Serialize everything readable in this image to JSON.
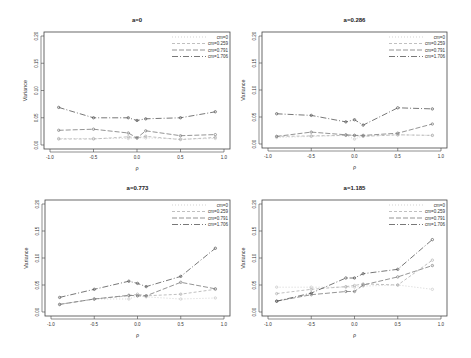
{
  "figure": {
    "ylabel": "Variance",
    "xlabel": "ρ",
    "colors": {
      "cm=0": "#c8c8c8",
      "cm=0.259": "#b0b0b0",
      "cm=0.791": "#7a7a7a",
      "cm=1.706": "#555555"
    }
  },
  "chart_data": [
    {
      "type": "line",
      "title": "a=0",
      "xlabel": "ρ",
      "ylabel": "Variance",
      "xlim": [
        -1.0,
        1.0
      ],
      "ylim": [
        0.0,
        0.2
      ],
      "xticks": [
        "-1.0",
        "-0.5",
        "0.0",
        "0.5",
        "1.0"
      ],
      "yticks": [
        "0.00",
        "0.05",
        "0.10",
        "0.15",
        "0.20"
      ],
      "legend": [
        "cm=0",
        "cm=0.259",
        "cm=0.791",
        "cm=1.706"
      ],
      "legend_position": "top-right",
      "x": [
        -0.9,
        -0.5,
        -0.1,
        0.0,
        0.1,
        0.5,
        0.9
      ],
      "series": [
        {
          "name": "cm=0",
          "values": [
            0.012,
            0.012,
            0.012,
            0.013,
            0.013,
            0.011,
            0.012
          ]
        },
        {
          "name": "cm=0.259",
          "values": [
            0.011,
            0.011,
            0.015,
            0.013,
            0.016,
            0.01,
            0.014
          ]
        },
        {
          "name": "cm=0.791",
          "values": [
            0.027,
            0.029,
            0.022,
            0.013,
            0.026,
            0.017,
            0.019
          ]
        },
        {
          "name": "cm=1.706",
          "values": [
            0.069,
            0.05,
            0.05,
            0.045,
            0.048,
            0.05,
            0.061
          ]
        }
      ]
    },
    {
      "type": "line",
      "title": "a=0.286",
      "xlabel": "ρ",
      "ylabel": "Variance",
      "xlim": [
        -1.0,
        1.0
      ],
      "ylim": [
        0.0,
        0.2
      ],
      "xticks": [
        "-1.0",
        "-0.5",
        "0.0",
        "0.5",
        "1.0"
      ],
      "yticks": [
        "0.00",
        "0.05",
        "0.10",
        "0.15",
        "0.20"
      ],
      "legend": [
        "cm=0",
        "cm=0.259",
        "cm=0.791",
        "cm=1.706"
      ],
      "legend_position": "top-right",
      "x": [
        -0.9,
        -0.5,
        -0.1,
        0.0,
        0.1,
        0.5,
        0.9
      ],
      "series": [
        {
          "name": "cm=0",
          "values": [
            0.012,
            0.014,
            0.016,
            0.009,
            0.015,
            0.017,
            0.016
          ]
        },
        {
          "name": "cm=0.259",
          "values": [
            0.014,
            0.015,
            0.016,
            0.016,
            0.014,
            0.017,
            0.016
          ]
        },
        {
          "name": "cm=0.791",
          "values": [
            0.014,
            0.022,
            0.017,
            0.016,
            0.016,
            0.02,
            0.037
          ]
        },
        {
          "name": "cm=1.706",
          "values": [
            0.056,
            0.053,
            0.041,
            0.045,
            0.035,
            0.067,
            0.065
          ]
        }
      ]
    },
    {
      "type": "line",
      "title": "a=0.773",
      "xlabel": "ρ",
      "ylabel": "Variance",
      "xlim": [
        -1.0,
        1.0
      ],
      "ylim": [
        0.0,
        0.2
      ],
      "xticks": [
        "-1.0",
        "-0.5",
        "0.0",
        "0.5",
        "1.0"
      ],
      "yticks": [
        "0.00",
        "0.05",
        "0.10",
        "0.15",
        "0.20"
      ],
      "legend": [
        "cm=0",
        "cm=0.259",
        "cm=0.791",
        "cm=1.706"
      ],
      "legend_position": "top-right",
      "x": [
        -0.9,
        -0.5,
        -0.1,
        0.0,
        0.1,
        0.5,
        0.9
      ],
      "series": [
        {
          "name": "cm=0",
          "values": [
            0.014,
            0.024,
            0.024,
            0.03,
            0.028,
            0.024,
            0.026
          ]
        },
        {
          "name": "cm=0.259",
          "values": [
            0.014,
            0.024,
            0.03,
            0.033,
            0.03,
            0.033,
            0.042
          ]
        },
        {
          "name": "cm=0.791",
          "values": [
            0.014,
            0.024,
            0.031,
            0.03,
            0.03,
            0.055,
            0.043
          ]
        },
        {
          "name": "cm=1.706",
          "values": [
            0.027,
            0.042,
            0.057,
            0.053,
            0.047,
            0.066,
            0.118
          ]
        }
      ]
    },
    {
      "type": "line",
      "title": "a=1.185",
      "xlabel": "ρ",
      "ylabel": "Variance",
      "xlim": [
        -1.0,
        1.0
      ],
      "ylim": [
        0.0,
        0.2
      ],
      "xticks": [
        "-1.0",
        "-0.5",
        "0.0",
        "0.5",
        "1.0"
      ],
      "yticks": [
        "0.00",
        "0.05",
        "0.10",
        "0.15",
        "0.20"
      ],
      "legend": [
        "cm=0",
        "cm=0.259",
        "cm=0.791",
        "cm=1.706"
      ],
      "legend_position": "top-right",
      "x": [
        -0.9,
        -0.5,
        -0.1,
        0.0,
        0.1,
        0.5,
        0.9
      ],
      "series": [
        {
          "name": "cm=0",
          "values": [
            0.046,
            0.046,
            0.046,
            0.046,
            0.048,
            0.05,
            0.042
          ]
        },
        {
          "name": "cm=0.259",
          "values": [
            0.034,
            0.042,
            0.047,
            0.049,
            0.052,
            0.05,
            0.096
          ]
        },
        {
          "name": "cm=0.791",
          "values": [
            0.02,
            0.032,
            0.038,
            0.038,
            0.05,
            0.065,
            0.086
          ]
        },
        {
          "name": "cm=1.706",
          "values": [
            0.02,
            0.035,
            0.063,
            0.063,
            0.071,
            0.079,
            0.134
          ]
        }
      ]
    }
  ]
}
